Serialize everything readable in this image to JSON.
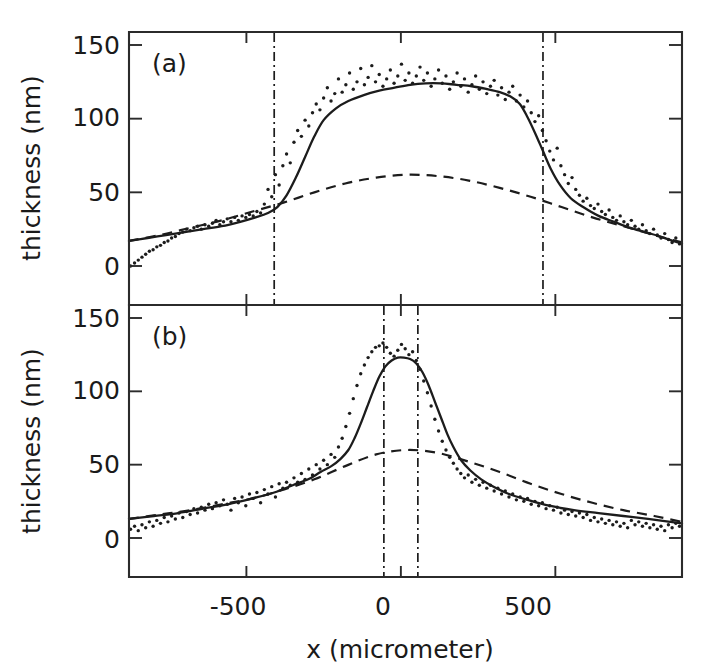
{
  "figure": {
    "background_color": "#ffffff",
    "ink_color": "#1c1c1c",
    "x_axis_title": "x (micrometer)",
    "y_axis_title": "thickness (nm)",
    "x_tick_labels": [
      "-500",
      "0",
      "500"
    ],
    "y_tick_labels": [
      "0",
      "50",
      "100",
      "150"
    ],
    "panel_a_tag": "(a)",
    "panel_b_tag": "(b)"
  },
  "chart_data": [
    {
      "type": "line",
      "panel": "(a)",
      "title": "(a)",
      "xlabel": "x (micrometer)",
      "ylabel": "thickness (nm)",
      "xlim": [
        -880,
        910
      ],
      "ylim": [
        0,
        163
      ],
      "xticks": [
        -500,
        0,
        500
      ],
      "yticks": [
        0,
        50,
        100,
        150
      ],
      "grid": false,
      "legend": "none",
      "annotations": [
        {
          "kind": "panel-label",
          "text": "(a)",
          "x": -790,
          "y": 150
        },
        {
          "kind": "vertical-dash-dot-line",
          "x": -410
        },
        {
          "kind": "vertical-dash-dot-line",
          "x": 460
        }
      ],
      "series": [
        {
          "name": "fit (solid)",
          "style": "solid",
          "x": [
            -880,
            -820,
            -760,
            -700,
            -640,
            -580,
            -520,
            -470,
            -430,
            -400,
            -370,
            -340,
            -310,
            -280,
            -250,
            -210,
            -170,
            -120,
            -70,
            -20,
            30,
            80,
            130,
            180,
            230,
            280,
            320,
            355,
            385,
            410,
            435,
            460,
            485,
            515,
            550,
            590,
            640,
            690,
            740,
            790,
            840,
            910
          ],
          "y": [
            17,
            19,
            21,
            23,
            25,
            27,
            30,
            33,
            36,
            40,
            48,
            60,
            74,
            88,
            99,
            107,
            112,
            116,
            119,
            121,
            123,
            124,
            124,
            123,
            122,
            120,
            118,
            115,
            110,
            101,
            90,
            78,
            66,
            55,
            46,
            40,
            34,
            30,
            26,
            23,
            20,
            15
          ]
        },
        {
          "name": "broad background (dashed)",
          "style": "dashed",
          "x": [
            -880,
            -780,
            -680,
            -580,
            -480,
            -380,
            -280,
            -180,
            -80,
            20,
            120,
            220,
            320,
            420,
            520,
            620,
            720,
            820,
            910
          ],
          "y": [
            17,
            21,
            26,
            31,
            37,
            43,
            50,
            56,
            60,
            62,
            61,
            58,
            53,
            47,
            40,
            33,
            27,
            21,
            16
          ]
        },
        {
          "name": "measured data (dotted)",
          "style": "dotted",
          "x": [
            -875,
            -862,
            -850,
            -838,
            -826,
            -814,
            -802,
            -790,
            -778,
            -766,
            -754,
            -742,
            -730,
            -718,
            -706,
            -694,
            -682,
            -670,
            -658,
            -646,
            -634,
            -622,
            -610,
            -598,
            -586,
            -574,
            -562,
            -550,
            -538,
            -526,
            -514,
            -502,
            -490,
            -478,
            -466,
            -454,
            -442,
            -430,
            -418,
            -406,
            -394,
            -382,
            -370,
            -358,
            -346,
            -334,
            -322,
            -310,
            -298,
            -286,
            -274,
            -262,
            -250,
            -238,
            -226,
            -214,
            -202,
            -190,
            -178,
            -166,
            -154,
            -142,
            -130,
            -118,
            -106,
            -94,
            -82,
            -70,
            -58,
            -46,
            -34,
            -22,
            -10,
            2,
            14,
            26,
            38,
            50,
            62,
            74,
            86,
            98,
            110,
            122,
            134,
            146,
            158,
            170,
            182,
            194,
            206,
            218,
            230,
            242,
            254,
            266,
            278,
            290,
            302,
            314,
            326,
            338,
            350,
            362,
            374,
            386,
            398,
            410,
            422,
            434,
            446,
            458,
            470,
            482,
            494,
            506,
            518,
            530,
            542,
            554,
            566,
            578,
            590,
            602,
            614,
            626,
            638,
            650,
            662,
            674,
            686,
            698,
            710,
            722,
            734,
            746,
            758,
            770,
            782,
            794,
            806,
            818,
            830,
            842,
            854,
            866,
            878,
            890,
            902
          ],
          "y": [
            0,
            2,
            4,
            6,
            8,
            10,
            11,
            13,
            14,
            16,
            17,
            19,
            20,
            22,
            23,
            25,
            24,
            26,
            27,
            25,
            28,
            27,
            29,
            31,
            28,
            30,
            32,
            30,
            33,
            31,
            34,
            33,
            35,
            34,
            37,
            36,
            42,
            52,
            47,
            62,
            55,
            68,
            76,
            70,
            84,
            92,
            88,
            99,
            95,
            104,
            110,
            106,
            114,
            121,
            112,
            117,
            127,
            118,
            123,
            131,
            120,
            125,
            134,
            123,
            128,
            136,
            125,
            130,
            122,
            127,
            133,
            124,
            129,
            137,
            126,
            131,
            124,
            129,
            135,
            126,
            131,
            122,
            127,
            133,
            124,
            129,
            120,
            125,
            131,
            122,
            127,
            118,
            123,
            129,
            120,
            125,
            117,
            122,
            126,
            116,
            121,
            113,
            118,
            122,
            112,
            116,
            108,
            112,
            104,
            98,
            102,
            92,
            85,
            78,
            72,
            80,
            68,
            62,
            56,
            60,
            52,
            48,
            44,
            46,
            41,
            39,
            42,
            37,
            35,
            38,
            33,
            31,
            34,
            30,
            28,
            31,
            27,
            25,
            28,
            24,
            22,
            25,
            21,
            19,
            22,
            18,
            16,
            19,
            15,
            13
          ]
        }
      ]
    },
    {
      "type": "line",
      "panel": "(b)",
      "title": "(b)",
      "xlabel": "x (micrometer)",
      "ylabel": "thickness (nm)",
      "xlim": [
        -880,
        910
      ],
      "ylim": [
        0,
        163
      ],
      "xticks": [
        -500,
        0,
        500
      ],
      "yticks": [
        0,
        50,
        100,
        150
      ],
      "grid": false,
      "legend": "none",
      "annotations": [
        {
          "kind": "panel-label",
          "text": "(b)",
          "x": -790,
          "y": 150
        },
        {
          "kind": "vertical-dash-dot-line",
          "x": -55
        },
        {
          "kind": "vertical-dash-dot-line",
          "x": 55
        }
      ],
      "series": [
        {
          "name": "fit (solid)",
          "style": "solid",
          "x": [
            -880,
            -800,
            -720,
            -640,
            -560,
            -480,
            -410,
            -350,
            -300,
            -260,
            -225,
            -195,
            -170,
            -150,
            -130,
            -110,
            -90,
            -70,
            -50,
            -30,
            -10,
            10,
            30,
            50,
            70,
            90,
            110,
            130,
            150,
            170,
            195,
            225,
            260,
            300,
            350,
            410,
            480,
            560,
            640,
            720,
            800,
            910
          ],
          "y": [
            13,
            15,
            17,
            20,
            23,
            27,
            31,
            36,
            40,
            45,
            49,
            54,
            60,
            68,
            78,
            89,
            100,
            110,
            117,
            121,
            123,
            123,
            122,
            119,
            113,
            104,
            93,
            82,
            71,
            62,
            53,
            46,
            40,
            35,
            30,
            26,
            22,
            19,
            17,
            15,
            13,
            10
          ]
        },
        {
          "name": "broad background (dashed)",
          "style": "dashed",
          "x": [
            -880,
            -780,
            -680,
            -580,
            -480,
            -380,
            -280,
            -180,
            -80,
            20,
            120,
            220,
            320,
            420,
            520,
            620,
            720,
            820,
            910
          ],
          "y": [
            13,
            16,
            19,
            23,
            27,
            33,
            40,
            49,
            57,
            60,
            58,
            52,
            45,
            37,
            30,
            24,
            19,
            15,
            11
          ]
        },
        {
          "name": "measured data (dotted)",
          "style": "dotted",
          "x": [
            -875,
            -862,
            -850,
            -838,
            -826,
            -814,
            -802,
            -790,
            -778,
            -766,
            -754,
            -742,
            -730,
            -718,
            -706,
            -694,
            -682,
            -670,
            -658,
            -646,
            -634,
            -622,
            -610,
            -598,
            -586,
            -574,
            -562,
            -550,
            -538,
            -526,
            -514,
            -502,
            -490,
            -478,
            -466,
            -454,
            -442,
            -430,
            -418,
            -406,
            -394,
            -382,
            -370,
            -358,
            -346,
            -334,
            -322,
            -310,
            -298,
            -286,
            -274,
            -262,
            -250,
            -238,
            -226,
            -214,
            -202,
            -190,
            -178,
            -166,
            -154,
            -142,
            -130,
            -118,
            -106,
            -94,
            -82,
            -70,
            -58,
            -46,
            -34,
            -22,
            -10,
            2,
            14,
            26,
            38,
            50,
            62,
            74,
            86,
            98,
            110,
            122,
            134,
            146,
            158,
            170,
            182,
            194,
            206,
            218,
            230,
            242,
            254,
            266,
            278,
            290,
            302,
            314,
            326,
            338,
            350,
            362,
            374,
            386,
            398,
            410,
            422,
            434,
            446,
            458,
            470,
            482,
            494,
            506,
            518,
            530,
            542,
            554,
            566,
            578,
            590,
            602,
            614,
            626,
            638,
            650,
            662,
            674,
            686,
            698,
            710,
            722,
            734,
            746,
            758,
            770,
            782,
            794,
            806,
            818,
            830,
            842,
            854,
            866,
            878,
            890,
            902
          ],
          "y": [
            6,
            8,
            5,
            9,
            7,
            11,
            8,
            12,
            10,
            14,
            11,
            15,
            13,
            17,
            14,
            18,
            16,
            20,
            17,
            21,
            19,
            23,
            20,
            24,
            22,
            26,
            23,
            19,
            27,
            24,
            28,
            22,
            30,
            27,
            31,
            24,
            33,
            30,
            35,
            28,
            37,
            34,
            38,
            36,
            41,
            38,
            44,
            40,
            47,
            43,
            50,
            47,
            53,
            50,
            57,
            55,
            62,
            68,
            76,
            85,
            95,
            104,
            112,
            118,
            123,
            127,
            130,
            131,
            133,
            130,
            126,
            124,
            128,
            132,
            129,
            125,
            127,
            121,
            115,
            107,
            99,
            90,
            81,
            73,
            66,
            60,
            55,
            51,
            47,
            44,
            41,
            43,
            38,
            40,
            36,
            38,
            34,
            36,
            32,
            34,
            30,
            32,
            28,
            30,
            26,
            28,
            25,
            27,
            23,
            25,
            22,
            24,
            20,
            22,
            19,
            21,
            17,
            19,
            16,
            18,
            15,
            17,
            14,
            16,
            12,
            14,
            11,
            13,
            10,
            12,
            9,
            11,
            8,
            10,
            7,
            12,
            9,
            11,
            8,
            10,
            7,
            9,
            6,
            8,
            5,
            9,
            7,
            10,
            8
          ]
        }
      ]
    }
  ]
}
